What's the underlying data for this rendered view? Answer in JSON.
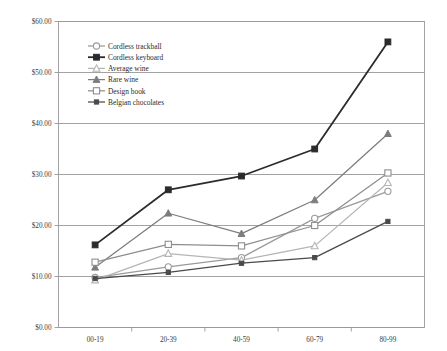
{
  "chart_data": {
    "type": "line",
    "title": "",
    "subtitle": "",
    "xlabel": "",
    "ylabel": "",
    "categories": [
      "00-19",
      "20-39",
      "40-59",
      "60-79",
      "80-99"
    ],
    "ylim": [
      0,
      60
    ],
    "ytick_values": [
      0,
      10,
      20,
      30,
      40,
      50,
      60
    ],
    "ytick_labels": [
      "$0.00",
      "$10.00",
      "$20.00",
      "$30.00",
      "$40.00",
      "$50.00",
      "$60.00"
    ],
    "grid": true,
    "legend_position": "inside-top-left",
    "series": [
      {
        "name": "Cordless trackball",
        "marker": "open-circle",
        "color": "#9a9a9a",
        "values": [
          9.8,
          11.9,
          13.7,
          21.4,
          26.7
        ]
      },
      {
        "name": "Cordless keyboard",
        "marker": "filled-square",
        "color": "#2b2b2b",
        "values": [
          16.2,
          27.0,
          29.7,
          35.0,
          56.0
        ]
      },
      {
        "name": "Average wine",
        "marker": "open-triangle",
        "color": "#b5b5b5",
        "values": [
          9.3,
          14.5,
          13.2,
          16.0,
          28.4
        ]
      },
      {
        "name": "Rare wine",
        "marker": "filled-triangle",
        "color": "#7d7d7d",
        "values": [
          11.8,
          22.4,
          18.4,
          25.0,
          38.0
        ]
      },
      {
        "name": "Design book",
        "marker": "open-square",
        "color": "#8e8e8e",
        "values": [
          12.8,
          16.3,
          16.0,
          20.0,
          30.3
        ]
      },
      {
        "name": "Belgian chocolates",
        "marker": "small-filled-square",
        "color": "#4a4a4a",
        "values": [
          9.6,
          10.8,
          12.6,
          13.7,
          20.8
        ]
      }
    ]
  }
}
